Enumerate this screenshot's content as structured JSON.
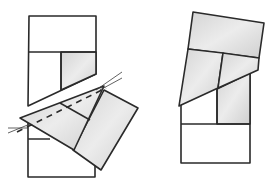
{
  "figure": {
    "colors": {
      "stroke": "#2a2a2a",
      "shade_light": "#e6e6e6",
      "shade_dark": "#c9c9c9",
      "background": "#ffffff"
    },
    "left_figure": {
      "label": "before-rotation",
      "upper_block": {
        "outer": [
          [
            29,
            16
          ],
          [
            96,
            16
          ],
          [
            96,
            74
          ],
          [
            28,
            106
          ]
        ],
        "divider_h": [
          [
            29,
            52
          ],
          [
            96,
            52
          ]
        ],
        "divider_v": [
          [
            61,
            52
          ],
          [
            61,
            90
          ]
        ],
        "shaded_cell": [
          [
            61,
            52
          ],
          [
            96,
            52
          ],
          [
            96,
            74
          ],
          [
            61,
            90
          ]
        ]
      },
      "rotated_pieces": {
        "triangle": [
          [
            20,
            118
          ],
          [
            104,
            86
          ],
          [
            74,
            150
          ]
        ],
        "inner_divider": [
          [
            60,
            103
          ],
          [
            90,
            120
          ]
        ],
        "square": [
          [
            104,
            90
          ],
          [
            138,
            108
          ],
          [
            101,
            170
          ],
          [
            73,
            150
          ]
        ]
      },
      "dashed_cut": [
        [
          17,
          132
        ],
        [
          106,
          88
        ]
      ],
      "guide_lines": [
        [
          [
            8,
            133
          ],
          [
            30,
            124
          ]
        ],
        [
          [
            8,
            128
          ],
          [
            28,
            128
          ]
        ],
        [
          [
            96,
            90
          ],
          [
            122,
            72
          ]
        ],
        [
          [
            100,
            90
          ],
          [
            122,
            78
          ]
        ]
      ],
      "lower_block": {
        "outer": [
          [
            28,
            118
          ],
          [
            95,
            118
          ],
          [
            95,
            177
          ],
          [
            28,
            177
          ]
        ],
        "divider_h": [
          [
            28,
            139
          ],
          [
            50,
            139
          ]
        ]
      }
    },
    "right_figure": {
      "label": "after-rotation",
      "top_piece": [
        [
          193,
          12
        ],
        [
          264,
          23
        ],
        [
          259,
          58
        ],
        [
          188,
          49
        ]
      ],
      "middle_left": [
        [
          188,
          49
        ],
        [
          223,
          53
        ],
        [
          218,
          88
        ],
        [
          179,
          106
        ]
      ],
      "middle_right": [
        [
          223,
          53
        ],
        [
          259,
          58
        ],
        [
          258,
          70
        ],
        [
          218,
          88
        ]
      ],
      "lower_block": {
        "outer": [
          [
            181,
            102
          ],
          [
            250,
            73
          ],
          [
            250,
            163
          ],
          [
            181,
            163
          ]
        ],
        "divider_h": [
          [
            181,
            124
          ],
          [
            250,
            124
          ]
        ],
        "divider_v": [
          [
            217,
            89
          ],
          [
            217,
            124
          ]
        ],
        "shaded_cell": [
          [
            217,
            89
          ],
          [
            250,
            73
          ],
          [
            250,
            124
          ],
          [
            217,
            124
          ]
        ]
      }
    }
  }
}
